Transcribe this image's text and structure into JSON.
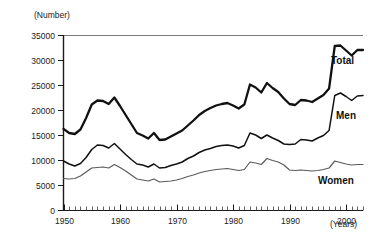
{
  "chart_data": {
    "type": "line",
    "title": "",
    "subtitle": "",
    "xlabel": "(Years)",
    "ylabel": "(Number)",
    "xlim": [
      1950,
      2003
    ],
    "ylim": [
      0,
      35000
    ],
    "grid": false,
    "legend_position": "inline-right-of-series",
    "y_ticks": [
      0,
      5000,
      10000,
      15000,
      20000,
      25000,
      30000,
      35000
    ],
    "y_tick_labels": [
      "0",
      "5000",
      "10000",
      "15000",
      "20000",
      "25000",
      "30000",
      "35000"
    ],
    "x_ticks": [
      1950,
      1960,
      1970,
      1980,
      1990,
      2000
    ],
    "x_tick_labels": [
      "1950",
      "1960",
      "1970",
      "1980",
      "1990",
      "2000"
    ],
    "x_minor_tick_interval": 1,
    "x": [
      1950,
      1951,
      1952,
      1953,
      1954,
      1955,
      1956,
      1957,
      1958,
      1959,
      1960,
      1961,
      1962,
      1963,
      1964,
      1965,
      1966,
      1967,
      1968,
      1969,
      1970,
      1971,
      1972,
      1973,
      1974,
      1975,
      1976,
      1977,
      1978,
      1979,
      1980,
      1981,
      1982,
      1983,
      1984,
      1985,
      1986,
      1987,
      1988,
      1989,
      1990,
      1991,
      1992,
      1993,
      1994,
      1995,
      1996,
      1997,
      1998,
      1999,
      2000,
      2001,
      2002,
      2003
    ],
    "series": [
      {
        "name": "Total",
        "color": "#111111",
        "line_width": "thick",
        "label_x": 2000,
        "values": [
          16311,
          15500,
          15300,
          16200,
          18500,
          21200,
          22000,
          21900,
          21300,
          22600,
          20900,
          19100,
          17300,
          15500,
          15000,
          14400,
          15500,
          14100,
          14200,
          14800,
          15400,
          16000,
          17000,
          18000,
          19100,
          19900,
          20500,
          21000,
          21300,
          21500,
          21000,
          20400,
          21200,
          25200,
          24600,
          23600,
          25500,
          24500,
          23700,
          22400,
          21300,
          21100,
          22100,
          22000,
          21700,
          22400,
          23100,
          24400,
          32900,
          33000,
          32000,
          31000,
          32100,
          32100
        ]
      },
      {
        "name": "Men",
        "color": "#111111",
        "line_width": "medium",
        "label_x": 2000,
        "values": [
          9900,
          9300,
          8900,
          9400,
          10600,
          12200,
          13100,
          13000,
          12500,
          13400,
          12300,
          11200,
          10200,
          9300,
          9100,
          8700,
          9300,
          8500,
          8600,
          9000,
          9300,
          9700,
          10400,
          10900,
          11600,
          12100,
          12400,
          12800,
          13000,
          13100,
          12900,
          12500,
          13000,
          15500,
          15100,
          14400,
          15100,
          14500,
          14000,
          13300,
          13200,
          13300,
          14200,
          14100,
          13900,
          14500,
          15000,
          16000,
          23000,
          23500,
          22800,
          22000,
          22900,
          23000
        ]
      },
      {
        "name": "Women",
        "color": "#5a5a5a",
        "line_width": "thin",
        "label_x": 1999,
        "values": [
          6400,
          6300,
          6400,
          6900,
          7700,
          8500,
          8600,
          8700,
          8500,
          9200,
          8600,
          7900,
          7100,
          6300,
          6100,
          5900,
          6300,
          5700,
          5800,
          5900,
          6100,
          6400,
          6800,
          7100,
          7500,
          7800,
          8000,
          8200,
          8300,
          8400,
          8200,
          8000,
          8200,
          9700,
          9500,
          9200,
          10400,
          10000,
          9700,
          9100,
          8100,
          8000,
          8100,
          8000,
          7900,
          8000,
          8200,
          8500,
          9900,
          9600,
          9300,
          9100,
          9200,
          9200
        ]
      }
    ]
  },
  "axis": {
    "y_unit_label": "(Number)",
    "x_unit_label": "(Years)"
  },
  "labels": {
    "total": "Total",
    "men": "Men",
    "women": "Women"
  }
}
